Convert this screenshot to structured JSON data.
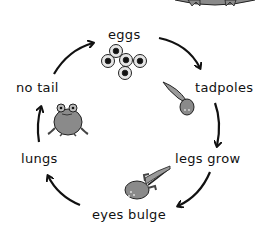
{
  "diagram": {
    "stages": [
      {
        "id": "eggs",
        "label": "eggs"
      },
      {
        "id": "tadpoles",
        "label": "tadpoles"
      },
      {
        "id": "legs-grow",
        "label": "legs grow"
      },
      {
        "id": "eyes-bulge",
        "label": "eyes bulge"
      },
      {
        "id": "lungs",
        "label": "lungs"
      },
      {
        "id": "no-tail",
        "label": "no tail"
      }
    ],
    "arrows": [
      {
        "from": "eggs",
        "to": "tadpoles"
      },
      {
        "from": "tadpoles",
        "to": "legs-grow"
      },
      {
        "from": "legs-grow",
        "to": "eyes-bulge"
      },
      {
        "from": "eyes-bulge",
        "to": "lungs"
      },
      {
        "from": "lungs",
        "to": "no-tail"
      },
      {
        "from": "no-tail",
        "to": "eggs"
      }
    ],
    "illustrations": [
      "frog-eggs",
      "tadpole",
      "tadpole-with-legs",
      "young-frog",
      "adult-frog-partial"
    ],
    "colors": {
      "line": "#111111",
      "fill_gray": "#8a8a8a",
      "egg_fill": "#e6e6e6"
    }
  }
}
